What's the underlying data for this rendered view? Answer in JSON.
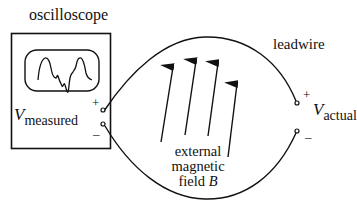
{
  "labels": {
    "oscilloscope": "oscilloscope",
    "leadwire": "leadwire",
    "v_measured_symbol": "V",
    "v_measured_subscript": "measured",
    "v_actual_symbol": "V",
    "v_actual_subscript": "actual",
    "field_line1": "external",
    "field_line2": "magnetic",
    "field_line3_text": "field ",
    "field_line3_symbol": "B"
  },
  "terminals": {
    "left_plus": "+",
    "left_minus": "–",
    "right_plus": "+",
    "right_minus": "–"
  },
  "colors": {
    "stroke": "#111111",
    "background": "#ffffff"
  }
}
